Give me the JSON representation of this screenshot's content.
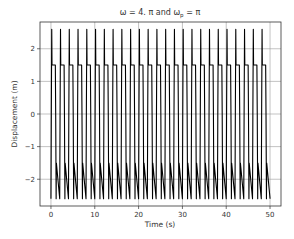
{
  "chart_data": {
    "type": "line",
    "title_parts": {
      "main": "ω = 4. π and ω",
      "sub": "p",
      "tail": " = π"
    },
    "xlabel": "Time (s)",
    "ylabel": "Displacement (m)",
    "xlim": [
      -2.5,
      52.5
    ],
    "ylim": [
      -2.82,
      2.82
    ],
    "xticks": [
      0,
      10,
      20,
      30,
      40,
      50
    ],
    "xtick_labels": [
      "0",
      "10",
      "20",
      "30",
      "40",
      "50"
    ],
    "yticks": [
      2,
      1,
      0,
      -1,
      -2
    ],
    "ytick_labels": [
      "2",
      "1",
      "0",
      "−1",
      "−2"
    ],
    "grid": true,
    "legend": null,
    "series": [
      {
        "name": "displacement",
        "color": "#000000",
        "description": "Periodic spiky oscillation, period ≈ 2 s (ω_p = π), 25 cycles over 0–50 s; peaks ≈ 2.6, troughs ≈ −2.6, with a kink near ±1.5 on each swing",
        "period": 2.0,
        "t_start": 0,
        "t_end": 50,
        "peak": 2.6,
        "trough": -2.6,
        "kink": 1.5,
        "cycle_shape": {
          "phase": [
            0.0,
            0.04,
            0.09,
            0.12,
            0.5,
            0.54,
            0.59,
            0.62,
            1.0
          ],
          "value": [
            -2.6,
            0.0,
            2.6,
            1.5,
            1.5,
            0.0,
            -2.6,
            -1.5,
            -2.6
          ]
        }
      }
    ]
  }
}
